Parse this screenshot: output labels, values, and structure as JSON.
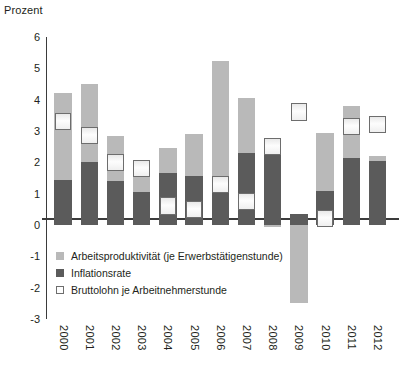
{
  "chart_data": {
    "type": "bar",
    "title": "",
    "unit_label": "Prozent",
    "xlabel": "",
    "ylabel": "Prozent",
    "ylim": [
      -3,
      6
    ],
    "ytick_values": [
      6,
      5,
      4,
      3,
      2,
      1,
      0,
      -1,
      -2,
      -3
    ],
    "ytick_labels": [
      "6",
      "5",
      "4",
      "3",
      "2",
      "1",
      "0",
      "-1",
      "-2",
      "-3"
    ],
    "grid": false,
    "legend_position": "inside-lower-left",
    "stacked": true,
    "categories": [
      "2000",
      "2001",
      "2002",
      "2003",
      "2004",
      "2005",
      "2006",
      "2007",
      "2008",
      "2009",
      "2010",
      "2011",
      "2012"
    ],
    "series": [
      {
        "name": "Arbeitsproduktivität (je Erwerbstätigenstunde)",
        "kind": "stacked-bar-upper",
        "color": "#b9b9b9",
        "values": [
          2.75,
          2.5,
          1.45,
          0.9,
          0.8,
          1.35,
          3.7,
          1.75,
          -0.05,
          -2.5,
          1.85,
          1.65,
          0.15
        ]
      },
      {
        "name": "Inflationsrate",
        "kind": "stacked-bar-lower",
        "color": "#5b5b5b",
        "values": [
          1.45,
          2.0,
          1.4,
          1.05,
          1.65,
          1.55,
          1.55,
          2.3,
          2.6,
          0.35,
          1.1,
          2.15,
          2.05
        ]
      },
      {
        "name": "Bruttolohn je Arbeitnehmerstunde",
        "kind": "marker-box",
        "color": "#fdfdfd",
        "values": [
          3.3,
          2.85,
          2.0,
          1.8,
          0.6,
          0.5,
          1.3,
          0.75,
          2.5,
          3.6,
          0.2,
          3.15,
          3.2
        ]
      }
    ],
    "bar_totals": [
      4.2,
      4.5,
      2.85,
      1.95,
      2.45,
      2.9,
      5.25,
      4.05,
      2.55,
      0.35,
      2.95,
      3.8,
      2.2
    ]
  },
  "legend": {
    "items": [
      {
        "label": "Arbeitsproduktivität (je Erwerbstätigenstunde)",
        "swatch": "productivity-swatch"
      },
      {
        "label": "Inflationsrate",
        "swatch": "inflation-swatch"
      },
      {
        "label": "Bruttolohn je Arbeitnehmerstunde",
        "swatch": "gross-wage-swatch"
      }
    ]
  }
}
